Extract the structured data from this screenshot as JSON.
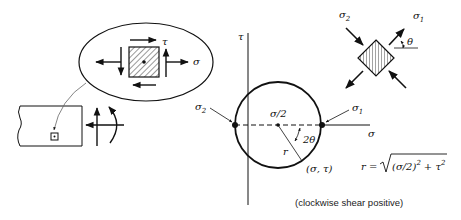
{
  "labels": {
    "tau": "τ",
    "sigma": "σ",
    "sigma1_main": "σ",
    "sigma1_sub": "1",
    "sigma2_main": "σ",
    "sigma2_sub": "2",
    "center": "σ/2",
    "two_theta": "2θ",
    "radius": "r",
    "point": "(σ, τ)",
    "theta": "θ",
    "formula_lhs": "r =",
    "formula_inner": "(σ/2)",
    "formula_exp": "2",
    "formula_plus": "+ τ",
    "formula_exp2": "2",
    "caption": "(clockwise shear positive)"
  },
  "colors": {
    "ink": "#111111",
    "hatch": "#333333",
    "thin": "#666666"
  }
}
